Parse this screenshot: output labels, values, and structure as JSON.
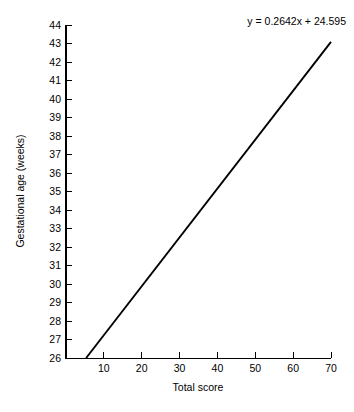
{
  "chart_data": {
    "type": "line",
    "title": "",
    "subtitle": "",
    "xlabel": "Total score",
    "ylabel": "Gestational age (weeks)",
    "xlim": [
      0,
      70
    ],
    "ylim": [
      26,
      44
    ],
    "grid": false,
    "legend": false,
    "x_ticks": [
      10,
      20,
      30,
      40,
      50,
      60,
      70
    ],
    "x_tick_labels": [
      "10",
      "20",
      "30",
      "40",
      "50",
      "60",
      "70"
    ],
    "y_ticks": [
      26,
      27,
      28,
      29,
      30,
      31,
      32,
      33,
      34,
      35,
      36,
      37,
      38,
      39,
      40,
      41,
      42,
      43,
      44
    ],
    "y_tick_labels": [
      "26",
      "27",
      "28",
      "29",
      "30",
      "31",
      "32",
      "33",
      "34",
      "35",
      "36",
      "37",
      "38",
      "39",
      "40",
      "41",
      "42",
      "43",
      "44"
    ],
    "series": [
      {
        "name": "regression line",
        "equation": "y = 0.2642x + 24.595",
        "slope": 0.2642,
        "intercept": 24.595,
        "x": [
          5.32,
          70
        ],
        "values": [
          26.0,
          43.089
        ],
        "color": "#000000"
      }
    ],
    "annotations": [
      {
        "name": "regression-equation",
        "text": "y = 0.2642x + 24.595",
        "position": "top-right"
      }
    ]
  },
  "annotation": {
    "equation_prefix": "y",
    "equation_full": "y = 0.2642x + 24.595"
  },
  "axes": {
    "x_title": "Total score",
    "y_title": "Gestational age (weeks)"
  },
  "colors": {
    "background": "#ffffff",
    "axis": "#000000",
    "line": "#000000",
    "text": "#000000"
  }
}
